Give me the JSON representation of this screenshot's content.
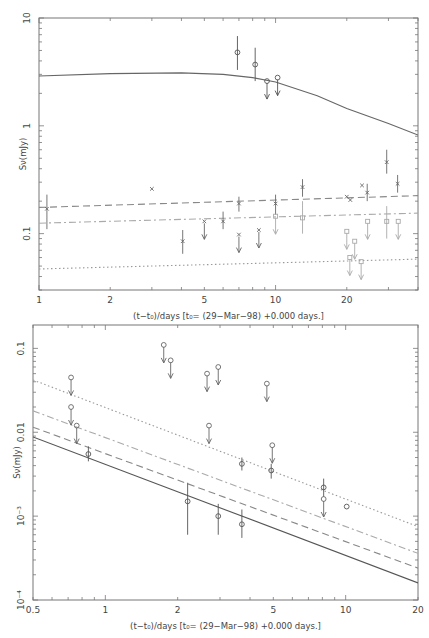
{
  "chart_data": [
    {
      "type": "scatter",
      "title": "",
      "xlabel": "(t-t0)/days [t0= (29-Mar-98) +0.000 days.]",
      "ylabel": "Sν(mJy)",
      "xscale": "log",
      "yscale": "log",
      "xlim": [
        1,
        40
      ],
      "ylim": [
        0.03,
        10
      ],
      "xticks": [
        1,
        2,
        5,
        10,
        20
      ],
      "xtick_labels": [
        "1",
        "2",
        "5",
        "10",
        "20"
      ],
      "yticks": [
        0.1,
        1,
        10
      ],
      "ytick_labels": [
        "0.1",
        "1",
        "10"
      ],
      "grid": false,
      "legend": null,
      "series": [
        {
          "name": "model-solid",
          "style": "solid",
          "color": "#666666",
          "x": [
            1,
            2,
            4,
            6,
            8,
            10,
            15,
            20,
            30,
            40
          ],
          "y": [
            2.9,
            3.05,
            3.1,
            3.0,
            2.8,
            2.55,
            1.9,
            1.45,
            1.05,
            0.82
          ]
        },
        {
          "name": "model-dashed",
          "style": "dashed",
          "color": "#888888",
          "x": [
            1,
            40
          ],
          "y": [
            0.175,
            0.225
          ]
        },
        {
          "name": "model-dashdot",
          "style": "dashdot",
          "color": "#aaaaaa",
          "x": [
            1,
            40
          ],
          "y": [
            0.125,
            0.155
          ]
        },
        {
          "name": "model-dotted",
          "style": "dotted",
          "color": "#999999",
          "x": [
            1,
            40
          ],
          "y": [
            0.047,
            0.058
          ]
        },
        {
          "name": "radio-detections",
          "marker": "circle",
          "color": "#555555",
          "points": [
            {
              "x": 6.9,
              "y": 4.8,
              "err": [
                3.3,
                6.8
              ],
              "limit": false
            },
            {
              "x": 8.2,
              "y": 3.7,
              "err": [
                2.6,
                5.3
              ],
              "limit": false
            },
            {
              "x": 9.2,
              "y": 2.6,
              "limit": true
            },
            {
              "x": 10.2,
              "y": 2.8,
              "limit": true
            }
          ]
        },
        {
          "name": "optical-dark",
          "marker": "star",
          "color": "#666666",
          "points": [
            {
              "x": 1.08,
              "y": 0.17,
              "err": [
                0.11,
                0.23
              ],
              "limit": false
            },
            {
              "x": 3.0,
              "y": 0.26,
              "limit": false
            },
            {
              "x": 4.05,
              "y": 0.085,
              "err": [
                0.065,
                0.108
              ],
              "limit": false
            },
            {
              "x": 5.0,
              "y": 0.13,
              "limit": true
            },
            {
              "x": 6.0,
              "y": 0.13,
              "err": [
                0.11,
                0.16
              ],
              "limit": false
            },
            {
              "x": 7.0,
              "y": 0.19,
              "err": [
                0.16,
                0.22
              ],
              "limit": false
            },
            {
              "x": 7.0,
              "y": 0.098,
              "limit": true
            },
            {
              "x": 8.5,
              "y": 0.108,
              "limit": true
            },
            {
              "x": 10.0,
              "y": 0.19,
              "err": [
                0.15,
                0.23
              ],
              "limit": false
            },
            {
              "x": 13.0,
              "y": 0.27,
              "err": [
                0.22,
                0.32
              ],
              "limit": false
            },
            {
              "x": 20.0,
              "y": 0.22,
              "limit": false
            },
            {
              "x": 20.7,
              "y": 0.205,
              "limit": false
            },
            {
              "x": 23.2,
              "y": 0.28,
              "limit": false
            },
            {
              "x": 24.4,
              "y": 0.24,
              "err": [
                0.2,
                0.29
              ],
              "limit": false
            },
            {
              "x": 29.5,
              "y": 0.46,
              "err": [
                0.36,
                0.6
              ],
              "limit": false
            },
            {
              "x": 32.8,
              "y": 0.29,
              "err": [
                0.24,
                0.35
              ],
              "limit": false
            }
          ]
        },
        {
          "name": "optical-light",
          "marker": "square",
          "color": "#aaaaaa",
          "points": [
            {
              "x": 10.0,
              "y": 0.145,
              "limit": true
            },
            {
              "x": 13.0,
              "y": 0.14,
              "err": [
                0.1,
                0.2
              ],
              "limit": false
            },
            {
              "x": 20.0,
              "y": 0.105,
              "limit": true
            },
            {
              "x": 20.6,
              "y": 0.06,
              "limit": true
            },
            {
              "x": 21.6,
              "y": 0.085,
              "limit": true
            },
            {
              "x": 23.0,
              "y": 0.055,
              "limit": true
            },
            {
              "x": 24.5,
              "y": 0.13,
              "limit": true
            },
            {
              "x": 29.5,
              "y": 0.13,
              "err": [
                0.09,
                0.18
              ],
              "limit": false
            },
            {
              "x": 33.0,
              "y": 0.13,
              "limit": true
            }
          ]
        }
      ]
    },
    {
      "type": "scatter",
      "title": "",
      "xlabel": "(t-t0)/days [t0= (29-Mar-98) +0.000 days.]",
      "ylabel": "Sν(mJy)",
      "xscale": "log",
      "yscale": "log",
      "xlim": [
        0.5,
        20
      ],
      "ylim": [
        0.0001,
        0.19
      ],
      "xticks": [
        0.5,
        1,
        2,
        5,
        10,
        20
      ],
      "xtick_labels": [
        "0.5",
        "1",
        "2",
        "5",
        "10",
        "20"
      ],
      "yticks": [
        0.0001,
        0.001,
        0.01,
        0.1
      ],
      "ytick_labels": [
        "10^-4",
        "10^-3",
        "0.01",
        "0.1"
      ],
      "grid": false,
      "legend": null,
      "series": [
        {
          "name": "model-solid",
          "style": "solid",
          "color": "#555555",
          "x": [
            0.5,
            20
          ],
          "y": [
            0.0088,
            0.00016
          ]
        },
        {
          "name": "model-dashed",
          "style": "dashed",
          "color": "#888888",
          "x": [
            0.5,
            20
          ],
          "y": [
            0.0115,
            0.00024
          ]
        },
        {
          "name": "model-dashdot",
          "style": "dashdot",
          "color": "#aaaaaa",
          "x": [
            0.5,
            20
          ],
          "y": [
            0.018,
            0.00036
          ]
        },
        {
          "name": "model-dotted",
          "style": "dotted",
          "color": "#999999",
          "x": [
            0.5,
            20
          ],
          "y": [
            0.042,
            0.00075
          ]
        },
        {
          "name": "detections",
          "marker": "circle",
          "color": "#555555",
          "points": [
            {
              "x": 0.85,
              "y": 0.0055,
              "err": [
                0.0045,
                0.0068
              ],
              "limit": false
            },
            {
              "x": 2.2,
              "y": 0.0015,
              "err": [
                0.0006,
                0.0025
              ],
              "limit": false
            },
            {
              "x": 2.95,
              "y": 0.001,
              "err": [
                0.0006,
                0.0014
              ],
              "limit": false
            },
            {
              "x": 3.7,
              "y": 0.0008,
              "err": [
                0.00055,
                0.0012
              ],
              "limit": false
            },
            {
              "x": 3.7,
              "y": 0.0042,
              "err": [
                0.0035,
                0.005
              ],
              "limit": false
            },
            {
              "x": 4.9,
              "y": 0.0035,
              "err": [
                0.0028,
                0.0042
              ],
              "limit": false
            },
            {
              "x": 8.1,
              "y": 0.0022,
              "err": [
                0.0017,
                0.0028
              ],
              "limit": false
            },
            {
              "x": 10.1,
              "y": 0.0013,
              "limit": false
            }
          ]
        },
        {
          "name": "upper-limits",
          "marker": "circle",
          "color": "#666666",
          "points": [
            {
              "x": 0.72,
              "y": 0.045,
              "limit": true
            },
            {
              "x": 0.72,
              "y": 0.02,
              "limit": true
            },
            {
              "x": 0.76,
              "y": 0.012,
              "limit": true
            },
            {
              "x": 1.75,
              "y": 0.11,
              "limit": true
            },
            {
              "x": 1.87,
              "y": 0.072,
              "limit": true
            },
            {
              "x": 2.65,
              "y": 0.05,
              "limit": true
            },
            {
              "x": 2.7,
              "y": 0.012,
              "limit": true
            },
            {
              "x": 2.95,
              "y": 0.06,
              "limit": true
            },
            {
              "x": 4.7,
              "y": 0.038,
              "limit": true
            },
            {
              "x": 4.95,
              "y": 0.007,
              "limit": true
            },
            {
              "x": 8.1,
              "y": 0.0016,
              "limit": true
            }
          ]
        }
      ]
    }
  ],
  "charts": {
    "top": {
      "ylabel": "Sν(mJy)",
      "xlabel": "(t−t₀)/days [t₀= (29−Mar−98) +0.000 days.]",
      "xticks": [
        "1",
        "2",
        "5",
        "10",
        "20"
      ],
      "yticks": [
        "10",
        "1",
        "0.1"
      ]
    },
    "bottom": {
      "ylabel": "Sν(mJy)",
      "xlabel": "(t−t₀)/days [t₀= (29−Mar−98) +0.000 days.]",
      "xticks": [
        "0.5",
        "1",
        "2",
        "5",
        "10",
        "20"
      ],
      "yticks": [
        "0.1",
        "0.01",
        "10⁻³",
        "10⁻⁴"
      ]
    }
  }
}
